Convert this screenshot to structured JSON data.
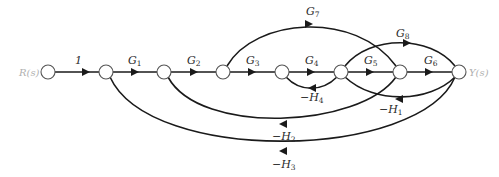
{
  "diagram": {
    "type": "signal-flow-graph",
    "input_label": "R(s)",
    "output_label": "Y(s)",
    "nodes": [
      {
        "id": "R",
        "x": 48,
        "y": 72
      },
      {
        "id": "n2",
        "x": 106,
        "y": 72
      },
      {
        "id": "n3",
        "x": 164,
        "y": 72
      },
      {
        "id": "n4",
        "x": 223,
        "y": 72
      },
      {
        "id": "n5",
        "x": 282,
        "y": 72
      },
      {
        "id": "n6",
        "x": 341,
        "y": 72
      },
      {
        "id": "n7",
        "x": 400,
        "y": 72
      },
      {
        "id": "Y",
        "x": 459,
        "y": 72
      }
    ],
    "branches": [
      {
        "from": "R",
        "to": "n2",
        "gain": "1",
        "gain_main": "1",
        "gain_sub": ""
      },
      {
        "from": "n2",
        "to": "n3",
        "gain": "G1",
        "gain_main": "G",
        "gain_sub": "1"
      },
      {
        "from": "n3",
        "to": "n4",
        "gain": "G2",
        "gain_main": "G",
        "gain_sub": "2"
      },
      {
        "from": "n4",
        "to": "n5",
        "gain": "G3",
        "gain_main": "G",
        "gain_sub": "3"
      },
      {
        "from": "n5",
        "to": "n6",
        "gain": "G4",
        "gain_main": "G",
        "gain_sub": "4"
      },
      {
        "from": "n6",
        "to": "n7",
        "gain": "G5",
        "gain_main": "G",
        "gain_sub": "5"
      },
      {
        "from": "n7",
        "to": "Y",
        "gain": "G6",
        "gain_main": "G",
        "gain_sub": "6"
      },
      {
        "from": "n4",
        "to": "n7",
        "gain": "G7",
        "gain_main": "G",
        "gain_sub": "7"
      },
      {
        "from": "n6",
        "to": "Y",
        "gain": "G8",
        "gain_main": "G",
        "gain_sub": "8"
      },
      {
        "from": "n6",
        "to": "n5",
        "gain": "-H4",
        "gain_main": "−H",
        "gain_sub": "4"
      },
      {
        "from": "Y",
        "to": "n6",
        "gain": "-H1",
        "gain_main": "−H",
        "gain_sub": "1"
      },
      {
        "from": "n7",
        "to": "n3",
        "gain": "-H2",
        "gain_main": "−H",
        "gain_sub": "2"
      },
      {
        "from": "Y",
        "to": "n2",
        "gain": "-H3",
        "gain_main": "−H",
        "gain_sub": "3"
      }
    ]
  }
}
